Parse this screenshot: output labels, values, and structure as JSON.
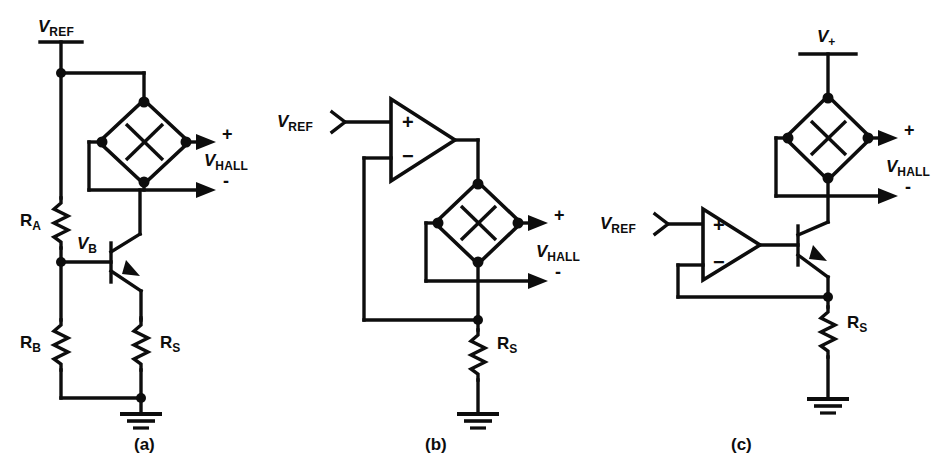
{
  "figure": {
    "background_color": "#ffffff",
    "ink_color": "#0d0d0d",
    "panels": [
      {
        "id": "a",
        "caption": "(a)",
        "description": "Resistor divider biased transistor current source driving Hall plate",
        "labels": {
          "supply": "V",
          "supply_sub": "REF",
          "base_node": "V",
          "base_node_sub": "B",
          "resistor_a": "R",
          "resistor_a_sub": "A",
          "resistor_b": "R",
          "resistor_b_sub": "B",
          "resistor_s": "R",
          "resistor_s_sub": "S",
          "output": "V",
          "output_sub": "HALL",
          "output_plus": "+",
          "output_minus": "-"
        },
        "components": [
          "voltage-supply-rail",
          "resistor-RA",
          "resistor-RB",
          "resistor-RS",
          "npn-transistor",
          "hall-plate",
          "ground"
        ]
      },
      {
        "id": "b",
        "caption": "(b)",
        "description": "Op-amp feedback current source driving Hall plate",
        "labels": {
          "reference": "V",
          "reference_sub": "REF",
          "resistor_s": "R",
          "resistor_s_sub": "S",
          "output": "V",
          "output_sub": "HALL",
          "output_plus": "+",
          "output_minus": "-",
          "opamp_plus": "+",
          "opamp_minus": "−"
        },
        "components": [
          "opamp",
          "hall-plate",
          "resistor-RS",
          "ground",
          "reference-terminal"
        ]
      },
      {
        "id": "c",
        "caption": "(c)",
        "description": "Op-amp plus transistor current source with separate supply rail driving Hall plate",
        "labels": {
          "supply": "V",
          "supply_sub": "+",
          "reference": "V",
          "reference_sub": "REF",
          "resistor_s": "R",
          "resistor_s_sub": "S",
          "output": "V",
          "output_sub": "HALL",
          "output_plus": "+",
          "output_minus": "-",
          "opamp_plus": "+",
          "opamp_minus": "−"
        },
        "components": [
          "voltage-supply-rail",
          "opamp",
          "npn-transistor",
          "hall-plate",
          "resistor-RS",
          "ground",
          "reference-terminal"
        ]
      }
    ]
  }
}
